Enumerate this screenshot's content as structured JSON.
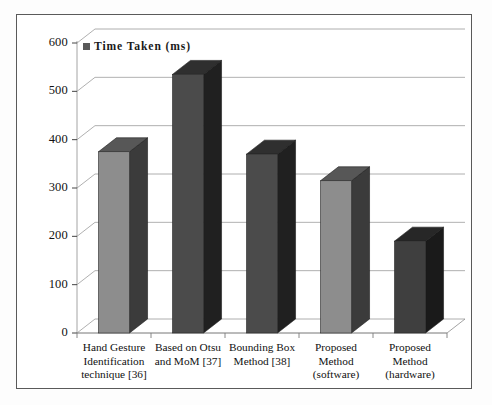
{
  "figure": {
    "legend": {
      "label": "Time Taken (ms)",
      "swatch_color": "#595959",
      "marker_icon": "legend-square-icon"
    },
    "frame_color": "#5a5a5a",
    "background": "#ffffff"
  },
  "chart_data": {
    "type": "bar",
    "title": "",
    "xlabel": "",
    "ylabel": "",
    "categories": [
      "Hand Gesture\nIdentification\ntechnique [36]",
      "Based on Otsu\nand MoM [37]",
      "Bounding Box\nMethod [38]",
      "Proposed\nMethod\n(software)",
      "Proposed\nMethod\n(hardware)"
    ],
    "values": [
      375,
      535,
      370,
      315,
      190
    ],
    "series": [
      {
        "name": "Time Taken (ms)",
        "values": [
          375,
          535,
          370,
          315,
          190
        ]
      }
    ],
    "bar_colors": [
      "#8d8d8d",
      "#4b4b4b",
      "#4b4b4b",
      "#8d8d8d",
      "#3f3f3f"
    ],
    "ylim": [
      0,
      600
    ],
    "yticks": [
      0,
      100,
      200,
      300,
      400,
      500,
      600
    ],
    "ytick_labels": [
      "0",
      "100",
      "200",
      "300",
      "400",
      "500",
      "600"
    ],
    "grid": true,
    "grid_color": "#8c8c8c",
    "legend_position": "top-left",
    "three_d": true
  }
}
